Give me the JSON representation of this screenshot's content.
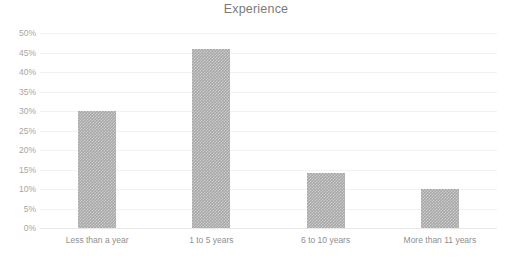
{
  "chart_data": {
    "type": "bar",
    "title": "Experience",
    "xlabel": "",
    "ylabel": "",
    "categories": [
      "Less than a year",
      "1 to 5 years",
      "6 to 10 years",
      "More than 11 years"
    ],
    "values": [
      30,
      46,
      14,
      10
    ],
    "value_labels": [
      "30%",
      "46%",
      "14%",
      "10%"
    ],
    "ylim": [
      0,
      50
    ],
    "ytick_values": [
      50,
      45,
      40,
      35,
      30,
      25,
      20,
      15,
      10,
      5,
      0
    ],
    "ytick_labels": [
      "50%",
      "45%",
      "40%",
      "35%",
      "30%",
      "25%",
      "20%",
      "15%",
      "10%",
      "5%",
      "0%"
    ],
    "grid": true,
    "legend": false,
    "legend_position": "none",
    "bar_color": "#a8a8a8",
    "grid_color": "#f2f2f2",
    "axis_color": "#e8e8e8",
    "title_color": "#7a7a7a",
    "tick_label_color": "#a6a6a6",
    "category_label_color": "#8f8f8f",
    "background_color": "#ffffff"
  }
}
